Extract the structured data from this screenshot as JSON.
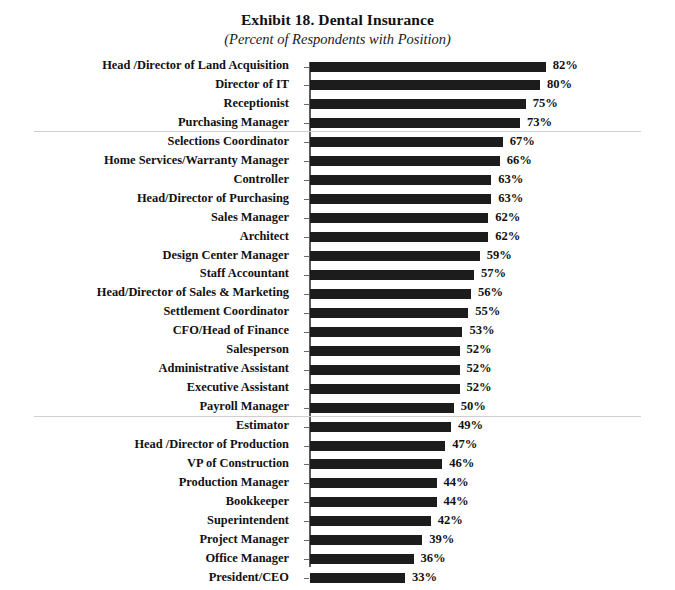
{
  "chart_data": {
    "type": "bar",
    "orientation": "horizontal",
    "title": "Exhibit 18. Dental Insurance",
    "subtitle": "(Percent of Respondents with Position)",
    "xlabel": "",
    "ylabel": "",
    "xlim": [
      0,
      100
    ],
    "grid": false,
    "legend": null,
    "value_suffix": "%",
    "categories": [
      "Head /Director of Land Acquisition",
      "Director of IT",
      "Receptionist",
      "Purchasing Manager",
      "Selections Coordinator",
      "Home Services/Warranty Manager",
      "Controller",
      "Head/Director of Purchasing",
      "Sales Manager",
      "Architect",
      "Design Center Manager",
      "Staff Accountant",
      "Head/Director of Sales & Marketing",
      "Settlement Coordinator",
      "CFO/Head of Finance",
      "Salesperson",
      "Administrative Assistant",
      "Executive Assistant",
      "Payroll Manager",
      "Estimator",
      "Head /Director of Production",
      "VP of Construction",
      "Production Manager",
      "Bookkeeper",
      "Superintendent",
      "Project Manager",
      "Office Manager",
      "President/CEO"
    ],
    "values": [
      82,
      80,
      75,
      73,
      67,
      66,
      63,
      63,
      62,
      62,
      59,
      57,
      56,
      55,
      53,
      52,
      52,
      52,
      50,
      49,
      47,
      46,
      44,
      44,
      42,
      39,
      36,
      33
    ],
    "value_labels": [
      "82%",
      "80%",
      "75%",
      "73%",
      "67%",
      "66%",
      "63%",
      "63%",
      "62%",
      "62%",
      "59%",
      "57%",
      "56%",
      "55%",
      "53%",
      "52%",
      "52%",
      "52%",
      "50%",
      "49%",
      "47%",
      "46%",
      "44%",
      "44%",
      "42%",
      "39%",
      "36%",
      "33%"
    ],
    "group_separators_after": [
      3,
      18
    ],
    "bar_color": "#1c1c1c",
    "separator_color": "#cfcfcf",
    "axis_color": "#5a5a5a",
    "background_color": "#ffffff"
  }
}
